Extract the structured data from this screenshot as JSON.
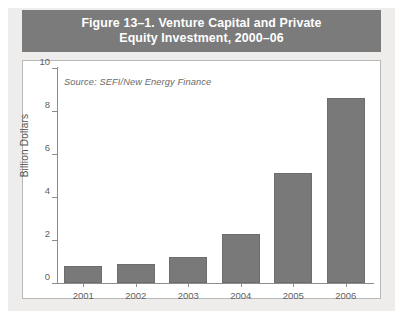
{
  "figure": {
    "title_line1": "Figure 13–1. Venture Capital and Private",
    "title_line2": "Equity Investment, 2000–06",
    "source_note": "Source: SEFI/New Energy Finance",
    "band_color": "#7b7b7b",
    "bar_color": "#797979",
    "plot_background": "#ffffff",
    "page_background": "#eeedeb"
  },
  "chart_data": {
    "type": "bar",
    "title": "Figure 13–1. Venture Capital and Private Equity Investment, 2000–06",
    "categories": [
      "2001",
      "2002",
      "2003",
      "2004",
      "2005",
      "2006"
    ],
    "values": [
      0.8,
      0.9,
      1.2,
      2.3,
      5.1,
      8.6
    ],
    "series": [
      {
        "name": "Venture capital and private equity investment",
        "values": [
          0.8,
          0.9,
          1.2,
          2.3,
          5.1,
          8.6
        ]
      }
    ],
    "xlabel": "",
    "ylabel": "Billion Dollars",
    "ylim": [
      0,
      10
    ],
    "yticks": [
      0,
      2,
      4,
      6,
      8,
      10
    ],
    "ytick_labels": [
      "0",
      "2",
      "4",
      "6",
      "8",
      "10"
    ],
    "grid": false,
    "legend": false,
    "annotations": [
      "Source: SEFI/New Energy Finance"
    ],
    "bar_color": "#797979",
    "units": "Billion Dollars"
  }
}
